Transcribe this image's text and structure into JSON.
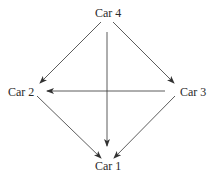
{
  "diagram": {
    "type": "directed-graph",
    "nodes": [
      {
        "id": "car4",
        "label": "Car 4"
      },
      {
        "id": "car2",
        "label": "Car 2"
      },
      {
        "id": "car3",
        "label": "Car 3"
      },
      {
        "id": "car1",
        "label": "Car 1"
      }
    ],
    "edges": [
      {
        "from": "Car 4",
        "to": "Car 2"
      },
      {
        "from": "Car 4",
        "to": "Car 3"
      },
      {
        "from": "Car 4",
        "to": "Car 1"
      },
      {
        "from": "Car 3",
        "to": "Car 2"
      },
      {
        "from": "Car 2",
        "to": "Car 1"
      },
      {
        "from": "Car 3",
        "to": "Car 1"
      }
    ],
    "colors": {
      "line": "#333333",
      "text": "#2a2a2a",
      "background": "#ffffff"
    }
  }
}
